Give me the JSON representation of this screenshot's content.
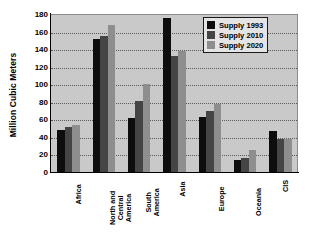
{
  "chart_data": {
    "type": "bar",
    "title": "",
    "subtitle": "",
    "xlabel": "",
    "ylabel": "Million Cubic Meters",
    "ylim": [
      0,
      180
    ],
    "ytick_step": 20,
    "yticks": [
      0,
      20,
      40,
      60,
      80,
      100,
      120,
      140,
      160,
      180
    ],
    "ytick_labels": [
      "0",
      "20",
      "40",
      "60",
      "80",
      "100",
      "120",
      "140",
      "160",
      "180"
    ],
    "grid": "horizontal-dotted",
    "legend_position": "top-right-inside",
    "categories": [
      "Africa",
      "North and\nCentral\nAmerica",
      "South\nAmerica",
      "Asia",
      "Europe",
      "Oceania",
      "CIS"
    ],
    "series": [
      {
        "name": "Supply 1993",
        "color": "#0d0d0d",
        "values": [
          48,
          152,
          62,
          176,
          63,
          14,
          47
        ]
      },
      {
        "name": "Supply 2010",
        "color": "#454545",
        "values": [
          51,
          155,
          81,
          132,
          70,
          16,
          38
        ]
      },
      {
        "name": "Supply 2020",
        "color": "#8e8e8e",
        "values": [
          54,
          168,
          100,
          138,
          78,
          25,
          38
        ]
      }
    ]
  },
  "legend": {
    "entries": [
      {
        "label": "Supply 1993"
      },
      {
        "label": "Supply 2010"
      },
      {
        "label": "Supply 2020"
      }
    ]
  },
  "colors": {
    "plot_background": "#c9c9c9",
    "page_background": "#ffffff",
    "axis": "#000000",
    "gridline": "#5a5a5a",
    "legend_background": "#e4e4e4",
    "series_1993": "#0d0d0d",
    "series_2010": "#454545",
    "series_2020": "#8e8e8e"
  }
}
